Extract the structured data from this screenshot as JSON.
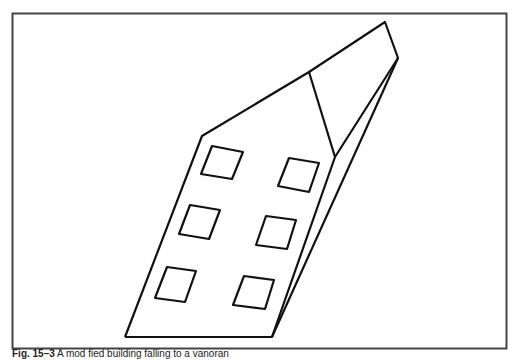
{
  "figure": {
    "window_count": 6,
    "stroke_color": "#111111",
    "frame_color": "#444444",
    "background_color": "#ffffff"
  },
  "caption": {
    "label": "Fig. 15–3",
    "text": "A mod fied building falling to a vanoran"
  }
}
